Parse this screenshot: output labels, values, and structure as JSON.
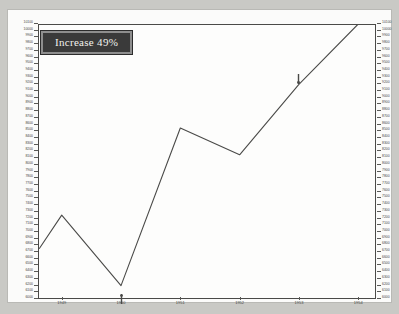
{
  "badge": {
    "text": "Increase 49%"
  },
  "chart_data": {
    "type": "line",
    "title": "Increase 49%",
    "xlabel": "",
    "ylabel": "",
    "grid": false,
    "legend": null,
    "x": [
      1949,
      1950,
      1951,
      1952,
      1953,
      1954
    ],
    "categories": [
      "1949",
      "1950",
      "1951",
      "1952",
      "1953",
      "1954"
    ],
    "xlim": [
      1948.6,
      1954.3
    ],
    "ylim": [
      6000,
      10100
    ],
    "ytick_step": 100,
    "ytick_labels": [
      "10100",
      "10000",
      "9900",
      "9800",
      "9700",
      "9600",
      "9500",
      "9400",
      "9300",
      "9200",
      "9100",
      "9000",
      "8900",
      "8800",
      "8700",
      "8600",
      "8500",
      "8400",
      "8300",
      "8200",
      "8100",
      "8000",
      "7900",
      "7800",
      "7700",
      "7600",
      "7500",
      "7400",
      "7300",
      "7200",
      "7100",
      "7000",
      "6900",
      "6800",
      "6700",
      "6600",
      "6500",
      "6400",
      "6300",
      "6200",
      "6100",
      "6000"
    ],
    "axes_sides": [
      "left",
      "right"
    ],
    "series": [
      {
        "name": "value",
        "points": [
          {
            "x": 1948.62,
            "y": 6750
          },
          {
            "x": 1949.0,
            "y": 7250
          },
          {
            "x": 1950.0,
            "y": 6200
          },
          {
            "x": 1951.0,
            "y": 8550
          },
          {
            "x": 1952.0,
            "y": 8150
          },
          {
            "x": 1953.0,
            "y": 9200
          },
          {
            "x": 1954.0,
            "y": 10100
          }
        ],
        "values": [
          7250,
          6200,
          8550,
          8150,
          9200,
          10100
        ]
      }
    ],
    "annotations": [
      {
        "name": "marker-1950",
        "x": 1950.0,
        "y": 6200,
        "position": "below",
        "glyph": "arrow-up"
      },
      {
        "name": "marker-1953",
        "x": 1953.0,
        "y": 9200,
        "position": "above",
        "glyph": "arrow-down"
      }
    ]
  },
  "colors": {
    "line": "#4a4a48",
    "axis": "#4a4a48",
    "badge_bg": "#3a3a3a",
    "badge_border": "#8e8e8e",
    "badge_text": "#f2f2ee",
    "page_bg": "#c9c9c5",
    "paper_bg": "#fbfbfa"
  }
}
